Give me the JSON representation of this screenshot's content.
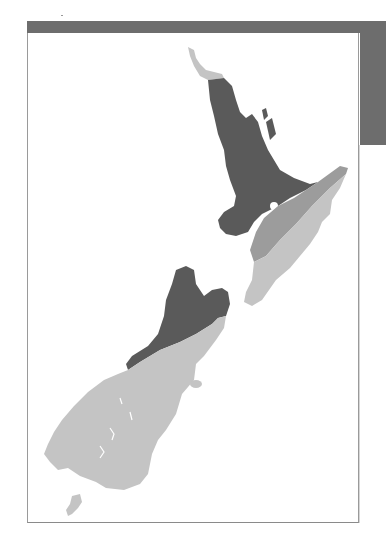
{
  "map": {
    "subject": "New Zealand",
    "regions": [
      {
        "name": "north-tip",
        "shade": "light"
      },
      {
        "name": "north-west-central",
        "shade": "dark"
      },
      {
        "name": "east-band",
        "shade": "medium"
      },
      {
        "name": "south-east-north",
        "shade": "light"
      },
      {
        "name": "north-west-south-island",
        "shade": "dark"
      },
      {
        "name": "south-island-remainder",
        "shade": "light"
      },
      {
        "name": "stewart-island",
        "shade": "light"
      }
    ],
    "colors": {
      "dark": "#5a5a5a",
      "medium": "#9c9c9c",
      "light": "#c4c4c4",
      "frame": "#6d6d6d"
    }
  }
}
